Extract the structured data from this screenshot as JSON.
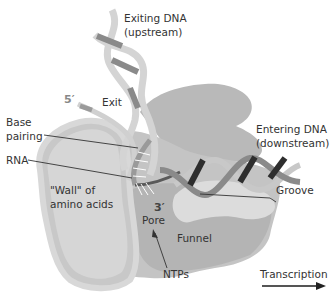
{
  "diagram": {
    "labels": {
      "exiting_dna_line1": "Exiting DNA",
      "exiting_dna_line2": "(upstream)",
      "five_prime": "5′",
      "exit": "Exit",
      "base_pairing_line1": "Base",
      "base_pairing_line2": "pairing",
      "rna": "RNA",
      "entering_dna_line1": "Entering DNA",
      "entering_dna_line2": "(downstream)",
      "groove": "Groove",
      "wall_line1": "\"Wall\" of",
      "wall_line2": "amino acids",
      "three_prime": "3′",
      "pore": "Pore",
      "funnel": "Funnel",
      "ntps": "NTPs",
      "transcription": "Transcription"
    },
    "colors": {
      "protein_dark": "#b9b9b9",
      "protein_mid": "#c9c9c9",
      "protein_light": "#dadada",
      "dna_light_strand": "#d4d4d4",
      "dna_mid_strand": "#8a8a8a",
      "dna_dark_strand": "#2e2e2e",
      "text": "#333333"
    }
  }
}
